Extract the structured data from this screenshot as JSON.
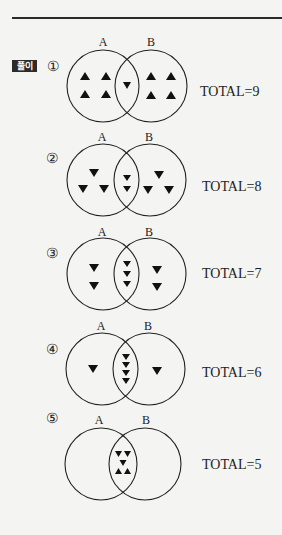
{
  "header": {
    "badge_label": "풀이"
  },
  "colors": {
    "ink": "#222222",
    "background": "#f4f4f2",
    "badge_bg": "#2b2b2b"
  },
  "diagrams": [
    {
      "number": "①",
      "set_labels": [
        "A",
        "B"
      ],
      "total_label": "TOTAL=9",
      "regions": {
        "a_only": [
          "up",
          "up",
          "up",
          "up"
        ],
        "intersection": [
          "down"
        ],
        "b_only": [
          "up",
          "up",
          "up",
          "up"
        ]
      }
    },
    {
      "number": "②",
      "set_labels": [
        "A",
        "B"
      ],
      "total_label": "TOTAL=8",
      "regions": {
        "a_only": [
          "down",
          "down",
          "down"
        ],
        "intersection": [
          "down",
          "down"
        ],
        "b_only": [
          "down",
          "down",
          "down"
        ]
      }
    },
    {
      "number": "③",
      "set_labels": [
        "A",
        "B"
      ],
      "total_label": "TOTAL=7",
      "regions": {
        "a_only": [
          "down",
          "down"
        ],
        "intersection": [
          "down",
          "down",
          "down"
        ],
        "b_only": [
          "down",
          "down"
        ]
      }
    },
    {
      "number": "④",
      "set_labels": [
        "A",
        "B"
      ],
      "total_label": "TOTAL=6",
      "regions": {
        "a_only": [
          "down"
        ],
        "intersection": [
          "down",
          "down",
          "down",
          "down"
        ],
        "b_only": [
          "down"
        ]
      }
    },
    {
      "number": "⑤",
      "set_labels": [
        "A",
        "B"
      ],
      "total_label": "TOTAL=5",
      "regions": {
        "a_only": [],
        "intersection": [
          "down",
          "down",
          "down",
          "up",
          "up"
        ],
        "b_only": []
      }
    }
  ]
}
